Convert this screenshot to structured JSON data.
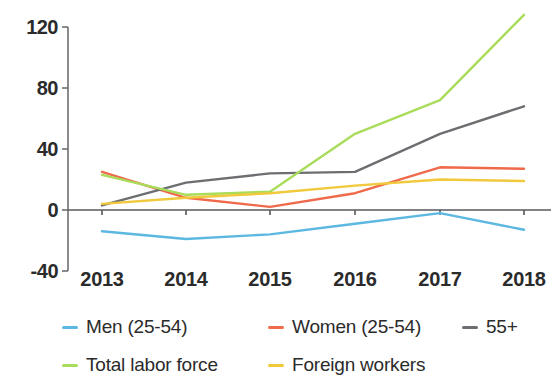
{
  "chart_data": {
    "type": "line",
    "title": "",
    "subtitle": "",
    "xlabel": "",
    "ylabel": "",
    "categories": [
      "2013",
      "2014",
      "2015",
      "2016",
      "2017",
      "2018"
    ],
    "x_tick_labels": [
      "2013",
      "2014",
      "2015",
      "2016",
      "2017",
      "2018"
    ],
    "y_tick_labels": [
      "120",
      "80",
      "40",
      "0",
      "-40"
    ],
    "y_ticks": [
      120,
      80,
      40,
      0,
      -40
    ],
    "ylim": [
      -40,
      130
    ],
    "grid": false,
    "legend_position": "bottom",
    "zero_line": true,
    "series": [
      {
        "name": "Men (25-54)",
        "color": "#5cb8e0",
        "values": [
          -14,
          -19,
          -16,
          -9,
          -2,
          -13
        ]
      },
      {
        "name": "Women (25-54)",
        "color": "#ef6a4a",
        "values": [
          25,
          8,
          2,
          11,
          28,
          27
        ]
      },
      {
        "name": "55+",
        "color": "#6d6e71",
        "values": [
          3,
          18,
          24,
          25,
          50,
          68
        ]
      },
      {
        "name": "Total labor force",
        "color": "#a8dc5a",
        "values": [
          23,
          10,
          12,
          50,
          72,
          128
        ]
      },
      {
        "name": "Foreign workers",
        "color": "#f0c93c",
        "values": [
          4,
          8,
          11,
          16,
          20,
          19
        ]
      }
    ]
  },
  "legend": {
    "items": [
      {
        "label": "Men (25-54)",
        "color": "#5cb8e0"
      },
      {
        "label": "Women (25-54)",
        "color": "#ef6a4a"
      },
      {
        "label": "55+",
        "color": "#6d6e71"
      },
      {
        "label": "Total labor force",
        "color": "#a8dc5a"
      },
      {
        "label": "Foreign workers",
        "color": "#f0c93c"
      }
    ]
  },
  "axis": {
    "line_color": "#6d6e71",
    "zero_line_color": "#58595b"
  }
}
